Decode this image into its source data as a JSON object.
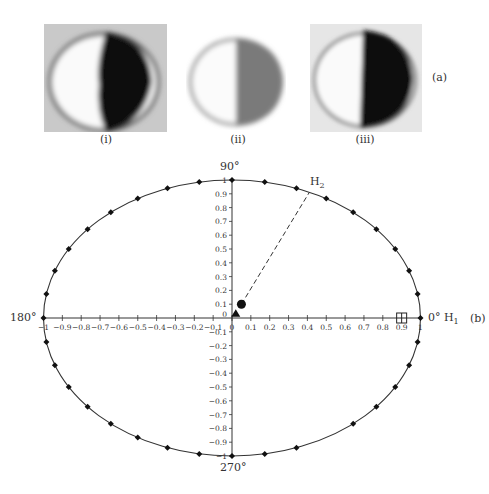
{
  "panel_a": {
    "label": "(a)",
    "images": [
      {
        "label": "(i)",
        "description": "circular disk, left half white, right half black",
        "dark_color": "#080808",
        "bg_color": "#c9c9c9"
      },
      {
        "label": "(ii)",
        "description": "circular disk, left half white, right half grey",
        "dark_color": "#7a7a7a",
        "bg_color": "#ffffff"
      },
      {
        "label": "(iii)",
        "description": "circular disk, left half white, right half black",
        "dark_color": "#0a0a0a",
        "bg_color": "#e6e6e6"
      }
    ]
  },
  "panel_b": {
    "label": "(b)",
    "angle_labels": {
      "top": "90°",
      "left": "180°",
      "right": "0°",
      "bottom": "270°"
    },
    "axis_labels": {
      "h1": "H",
      "h1_sub": "1",
      "h2": "H",
      "h2_sub": "2"
    }
  },
  "chart_data": {
    "type": "scatter",
    "title": "",
    "xlabel": "H1",
    "ylabel": "H2",
    "xlim": [
      -1,
      1
    ],
    "ylim": [
      -1,
      1
    ],
    "grid": false,
    "x_ticks": [
      -1,
      -0.9,
      -0.8,
      -0.7,
      -0.6,
      -0.5,
      -0.4,
      -0.3,
      -0.2,
      -0.1,
      0,
      0.1,
      0.2,
      0.3,
      0.4,
      0.5,
      0.6,
      0.7,
      0.8,
      0.9,
      1
    ],
    "y_ticks": [
      -1,
      -0.9,
      -0.8,
      -0.7,
      -0.6,
      -0.5,
      -0.4,
      -0.3,
      -0.2,
      -0.1,
      0,
      0.1,
      0.2,
      0.3,
      0.4,
      0.5,
      0.6,
      0.7,
      0.8,
      0.9,
      1
    ],
    "angle_annotations": [
      {
        "angle": 90,
        "label": "90°"
      },
      {
        "angle": 180,
        "label": "180°"
      },
      {
        "angle": 0,
        "label": "0° H1"
      },
      {
        "angle": 270,
        "label": "270°"
      }
    ],
    "series": [
      {
        "name": "unit circle reference (diamond markers every 10°)",
        "marker": "diamond",
        "angles_deg": [
          0,
          10,
          20,
          30,
          40,
          50,
          60,
          70,
          80,
          90,
          100,
          110,
          120,
          130,
          140,
          150,
          160,
          170,
          180,
          190,
          200,
          210,
          220,
          230,
          240,
          250,
          260,
          270,
          280,
          290,
          310,
          320,
          330,
          340,
          350
        ]
      },
      {
        "name": "circle point",
        "marker": "circle",
        "x": [
          0.05
        ],
        "y": [
          0.1
        ]
      },
      {
        "name": "triangle point",
        "marker": "triangle",
        "x": [
          0.02
        ],
        "y": [
          0.03
        ]
      },
      {
        "name": "square-cross point",
        "marker": "boxed-cross",
        "x": [
          0.9
        ],
        "y": [
          0.0
        ]
      }
    ],
    "annotations": [
      {
        "type": "dashed-line",
        "from": [
          0.05,
          0.1
        ],
        "to": [
          0.41,
          0.91
        ],
        "label": "H2"
      }
    ]
  }
}
